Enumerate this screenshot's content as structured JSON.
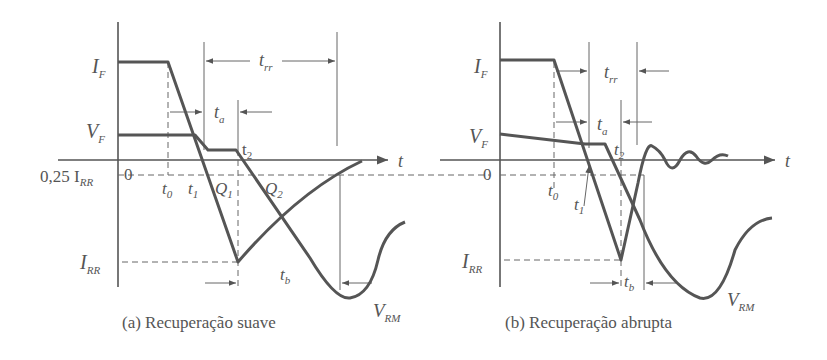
{
  "figure": {
    "panel_a": {
      "caption": "(a) Recuperação suave",
      "labels": {
        "IF": "I",
        "IF_sub": "F",
        "VF": "V",
        "VF_sub": "F",
        "IRR_quarter": "0,25 I",
        "IRR_quarter_sub": "RR",
        "zero": "0",
        "IRR": "I",
        "IRR_sub": "RR",
        "t0": "t",
        "t0_sub": "0",
        "t1": "t",
        "t1_sub": "1",
        "t2": "t",
        "t2_sub": "2",
        "Q1": "Q",
        "Q1_sub": "1",
        "Q2": "Q",
        "Q2_sub": "2",
        "ta": "t",
        "ta_sub": "a",
        "tb": "t",
        "tb_sub": "b",
        "trr": "t",
        "trr_sub": "rr",
        "VRM": "V",
        "VRM_sub": "RM",
        "t_axis": "t"
      }
    },
    "panel_b": {
      "caption": "(b) Recuperação abrupta",
      "labels": {
        "IF": "I",
        "IF_sub": "F",
        "VF": "V",
        "VF_sub": "F",
        "zero": "0",
        "IRR": "I",
        "IRR_sub": "RR",
        "t0": "t",
        "t0_sub": "0",
        "t1": "t",
        "t1_sub": "1",
        "t2": "t",
        "t2_sub": "2",
        "ta": "t",
        "ta_sub": "a",
        "tb": "t",
        "tb_sub": "b",
        "trr": "t",
        "trr_sub": "rr",
        "VRM": "V",
        "VRM_sub": "RM",
        "t_axis": "t"
      }
    }
  }
}
